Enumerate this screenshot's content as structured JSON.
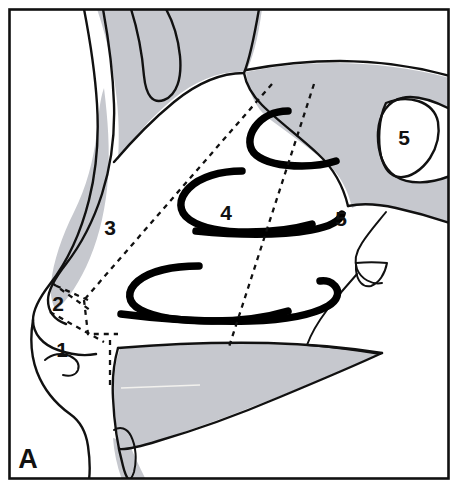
{
  "figure": {
    "panel_letter": "A",
    "caption_absent": true,
    "colors": {
      "bone_fill": "#c6c8ce",
      "air_fill": "#ffffff",
      "outline": "#111111",
      "turbinate": "#000000",
      "background": "#ffffff",
      "frame": "#111111"
    },
    "frame": {
      "x": 8,
      "y": 8,
      "width": 442,
      "height": 472
    }
  },
  "labels": [
    {
      "id": "label-1",
      "text": "1",
      "x": 62,
      "y": 357
    },
    {
      "id": "label-2",
      "text": "2",
      "x": 58,
      "y": 311
    },
    {
      "id": "label-3",
      "text": "3",
      "x": 110,
      "y": 235
    },
    {
      "id": "label-4",
      "text": "4",
      "x": 226,
      "y": 220
    },
    {
      "id": "label-5-nasopharynx",
      "text": "5",
      "x": 341,
      "y": 226
    },
    {
      "id": "label-5-sphenoid",
      "text": "5",
      "x": 404,
      "y": 145
    }
  ],
  "turbinates": [
    {
      "id": "superior-turbinate"
    },
    {
      "id": "middle-turbinate"
    },
    {
      "id": "inferior-turbinate"
    },
    {
      "id": "lower-posterior-curve"
    }
  ],
  "dashed_lines": [
    {
      "id": "dashed-anterior-boundary"
    },
    {
      "id": "dashed-posterior-boundary"
    },
    {
      "id": "dashed-vestibule-upper"
    },
    {
      "id": "dashed-vestibule-lower"
    },
    {
      "id": "dashed-vestibule-vertical"
    },
    {
      "id": "dashed-vestibule-step"
    }
  ]
}
